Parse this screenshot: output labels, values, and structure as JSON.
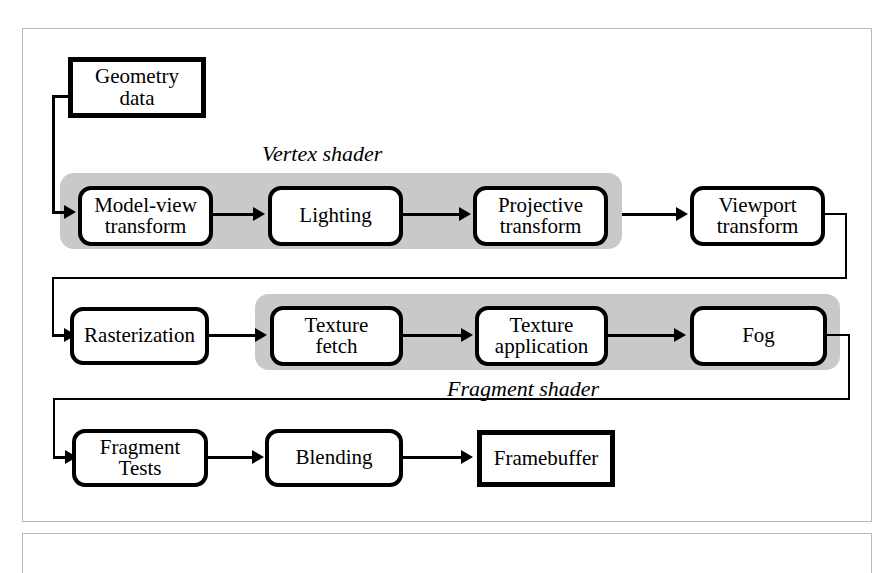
{
  "diagram": {
    "bands": [
      {
        "id": "vertex-shader",
        "caption": "Vertex shader",
        "fill": "#c9c9c9"
      },
      {
        "id": "fragment-shader",
        "caption": "Fragment shader",
        "fill": "#c9c9c9"
      }
    ],
    "rows": [
      {
        "id": "row-input",
        "nodes": [
          {
            "id": "geometry-data",
            "label": "Geometry\ndata",
            "line1": "Geometry",
            "line2": "data",
            "shape": "square"
          }
        ]
      },
      {
        "id": "row-vertex",
        "nodes": [
          {
            "id": "model-view-transform",
            "line1": "Model-view",
            "line2": "transform",
            "shape": "round",
            "in_band": "vertex-shader"
          },
          {
            "id": "lighting",
            "line1": "Lighting",
            "line2": "",
            "shape": "round",
            "in_band": "vertex-shader"
          },
          {
            "id": "projective-transform",
            "line1": "Projective",
            "line2": "transform",
            "shape": "round",
            "in_band": "vertex-shader"
          },
          {
            "id": "viewport-transform",
            "line1": "Viewport",
            "line2": "transform",
            "shape": "round",
            "in_band": ""
          }
        ]
      },
      {
        "id": "row-fragment",
        "nodes": [
          {
            "id": "rasterization",
            "line1": "Rasterization",
            "line2": "",
            "shape": "round",
            "in_band": ""
          },
          {
            "id": "texture-fetch",
            "line1": "Texture",
            "line2": "fetch",
            "shape": "round",
            "in_band": "fragment-shader"
          },
          {
            "id": "texture-application",
            "line1": "Texture",
            "line2": "application",
            "shape": "round",
            "in_band": "fragment-shader"
          },
          {
            "id": "fog",
            "line1": "Fog",
            "line2": "",
            "shape": "round",
            "in_band": "fragment-shader"
          }
        ]
      },
      {
        "id": "row-output",
        "nodes": [
          {
            "id": "fragment-tests",
            "line1": "Fragment",
            "line2": "Tests",
            "shape": "round",
            "in_band": ""
          },
          {
            "id": "blending",
            "line1": "Blending",
            "line2": "",
            "shape": "round",
            "in_band": ""
          },
          {
            "id": "framebuffer",
            "line1": "Framebuffer",
            "line2": "",
            "shape": "square",
            "in_band": ""
          }
        ]
      }
    ],
    "colors": {
      "band_fill": "#c9c9c9",
      "node_border": "#000000",
      "node_fill": "#ffffff",
      "frame_border": "#b9b9b9",
      "connector": "#000000"
    }
  }
}
